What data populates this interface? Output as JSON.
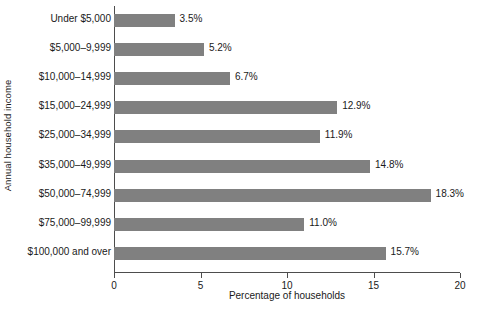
{
  "chart_data": {
    "type": "bar",
    "orientation": "horizontal",
    "title": "",
    "xlabel": "Percentage of households",
    "ylabel": "Annual household income",
    "xlim": [
      0,
      20
    ],
    "xticks": [
      0,
      5,
      10,
      15,
      20
    ],
    "xtick_labels": [
      "0",
      "5",
      "10",
      "15",
      "20"
    ],
    "grid": false,
    "legend": null,
    "bar_color": "#808080",
    "axis_color": "#4d4d4d",
    "categories": [
      "Under $5,000",
      "$5,000–9,999",
      "$10,000–14,999",
      "$15,000–24,999",
      "$25,000–34,999",
      "$35,000–49,999",
      "$50,000–74,999",
      "$75,000–99,999",
      "$100,000 and over"
    ],
    "values": [
      3.5,
      5.2,
      6.7,
      12.9,
      11.9,
      14.8,
      18.3,
      11.0,
      15.7
    ],
    "value_labels": [
      "3.5%",
      "5.2%",
      "6.7%",
      "12.9%",
      "11.9%",
      "14.8%",
      "18.3%",
      "11.0%",
      "15.7%"
    ]
  }
}
